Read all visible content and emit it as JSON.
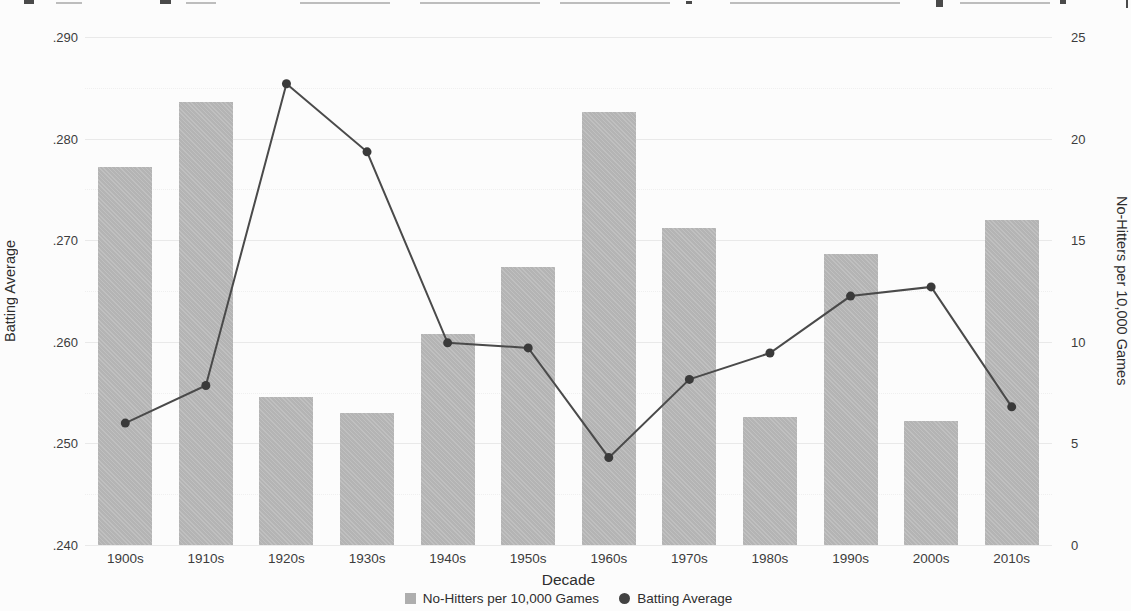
{
  "chart_data": {
    "type": "bar+line combo",
    "categories": [
      "1900s",
      "1910s",
      "1920s",
      "1930s",
      "1940s",
      "1950s",
      "1960s",
      "1970s",
      "1980s",
      "1990s",
      "2000s",
      "2010s"
    ],
    "series": [
      {
        "name": "No-Hitters per 10,000 Games",
        "type": "bar",
        "axis": "right",
        "color": "#b4b4b4",
        "values": [
          18.6,
          21.8,
          7.3,
          6.5,
          10.4,
          13.7,
          21.3,
          15.6,
          6.3,
          14.3,
          6.1,
          16.0
        ]
      },
      {
        "name": "Batting Average",
        "type": "line",
        "axis": "left",
        "color": "#4a4a4a",
        "values": [
          0.252,
          0.2557,
          0.2854,
          0.2787,
          0.2599,
          0.2594,
          0.2486,
          0.2563,
          0.2589,
          0.2645,
          0.2654,
          0.2536
        ]
      }
    ],
    "xlabel": "Decade",
    "left_axis": {
      "label": "Batting Average",
      "min": 0.24,
      "max": 0.29,
      "tick_step": 0.01,
      "tick_labels": [
        ".240",
        ".250",
        ".260",
        ".270",
        ".280",
        ".290"
      ]
    },
    "right_axis": {
      "label": "No-Hitters per 10,000 Games",
      "min": 0,
      "max": 25,
      "tick_step": 5,
      "tick_labels": [
        "0",
        "5",
        "10",
        "15",
        "20",
        "25"
      ]
    },
    "grid": {
      "major_solid": true,
      "minor_dotted": true
    },
    "legend_position": "bottom-center"
  },
  "legend": {
    "items": [
      {
        "label": "No-Hitters per 10,000 Games",
        "marker": "square",
        "color": "#aeaeae"
      },
      {
        "label": "Batting Average",
        "marker": "circle",
        "color": "#424242"
      }
    ]
  },
  "colors": {
    "bar_fill": "#b4b4b4",
    "line_stroke": "#4a4a4a",
    "point_fill": "#3a3a3a",
    "grid_major": "#e9e9e9",
    "grid_minor": "#efefef",
    "text": "#3a3a3a",
    "background": "#fcfcfc"
  }
}
